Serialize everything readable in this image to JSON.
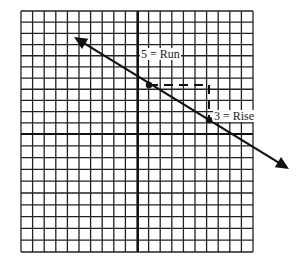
{
  "diagram": {
    "type": "coordinate-grid-slope",
    "grid": {
      "columns": 20,
      "rows_above_axis": 11,
      "rows_below_axis": 10,
      "left": 21,
      "top": 11,
      "right": 253,
      "bottom": 252,
      "y_axis_x": 138,
      "x_axis_y": 134
    },
    "line": {
      "start": [
        74,
        37
      ],
      "end": [
        289,
        169
      ],
      "arrows": "both"
    },
    "points": [
      {
        "x": 149,
        "y": 85
      },
      {
        "x": 209,
        "y": 120
      }
    ],
    "run_segment": {
      "from": [
        149,
        85
      ],
      "to": [
        209,
        85
      ],
      "style": "dashed"
    },
    "rise_segment": {
      "from": [
        209,
        85
      ],
      "to": [
        209,
        120
      ],
      "style": "dashed"
    },
    "labels": {
      "run": "5 = Run",
      "rise": "3 = Rise"
    },
    "colors": {
      "grid": "#222222",
      "line": "#111111",
      "background": "#ffffff"
    }
  }
}
